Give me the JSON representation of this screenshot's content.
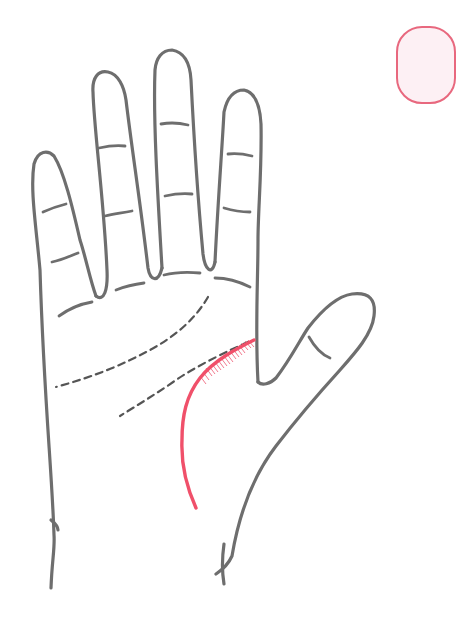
{
  "figure": {
    "caption": "Life line highlighted",
    "colors": {
      "outline": "#6e6e6e",
      "highlight": "#f0506a",
      "hatch": "#f27a8e",
      "badge_border": "#e8687e",
      "badge_fill": "#fdf0f4",
      "background": "#ffffff"
    },
    "lines": {
      "highlighted": "life-line",
      "dashed": [
        "head-line",
        "heart-line",
        "fate-line"
      ]
    }
  }
}
